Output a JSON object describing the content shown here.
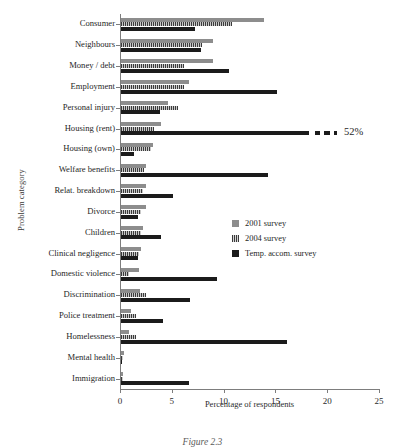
{
  "chart_data": {
    "type": "bar",
    "orientation": "horizontal",
    "title": "",
    "xlabel": "Percentage of respondents",
    "ylabel": "Problem category",
    "xlim": [
      0,
      25
    ],
    "xticks": [
      0,
      5,
      10,
      15,
      20,
      25
    ],
    "grid": false,
    "legend_position": "center-right",
    "categories": [
      "Consumer",
      "Neighbours",
      "Money / debt",
      "Employment",
      "Personal injury",
      "Housing (rent)",
      "Housing (own)",
      "Welfare benefits",
      "Relat. breakdown",
      "Divorce",
      "Children",
      "Clinical negligence",
      "Domestic violence",
      "Discrimination",
      "Police treatment",
      "Homelessness",
      "Mental health",
      "Immigration"
    ],
    "series": [
      {
        "name": "2001 survey",
        "color": "#8d8d8d",
        "values": [
          13.8,
          8.9,
          8.9,
          6.6,
          4.5,
          3.9,
          3.1,
          2.4,
          2.4,
          2.4,
          2.1,
          1.9,
          1.7,
          1.8,
          1.0,
          0.8,
          0.3,
          0.2
        ]
      },
      {
        "name": "2004 survey",
        "color": "#3b3b3b",
        "values": [
          10.7,
          7.8,
          6.1,
          6.1,
          5.5,
          3.2,
          2.9,
          2.2,
          2.1,
          1.9,
          1.9,
          1.7,
          0.8,
          2.4,
          1.4,
          1.4,
          0.2,
          0.2
        ]
      },
      {
        "name": "Temp. accom. survey",
        "color": "#1b1b1b",
        "values": [
          7.1,
          7.7,
          10.4,
          15.1,
          3.8,
          52.0,
          1.3,
          14.2,
          5.0,
          1.6,
          3.9,
          1.6,
          9.3,
          6.7,
          4.1,
          16.0,
          0.1,
          6.6
        ]
      }
    ],
    "annotations": [
      {
        "text": "52%",
        "category": "Housing (rent)",
        "series": "Temp. accom. survey",
        "note": "bar is broken/truncated at axis limit"
      }
    ]
  },
  "caption": "Figure 2.3"
}
